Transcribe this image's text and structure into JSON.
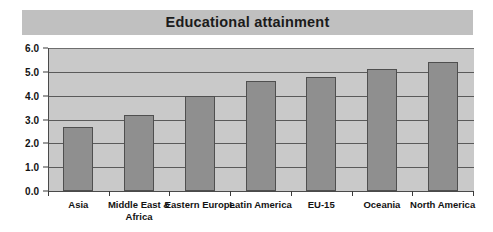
{
  "chart_data": {
    "type": "bar",
    "title": "Educational attainment",
    "xlabel": "",
    "ylabel": "",
    "ylim": [
      0.0,
      6.0
    ],
    "ytick_step": 1.0,
    "ytick_labels": [
      "6.0",
      "5.0",
      "4.0",
      "3.0",
      "2.0",
      "1.0",
      "0.0"
    ],
    "ytick_values": [
      6.0,
      5.0,
      4.0,
      3.0,
      2.0,
      1.0,
      0.0
    ],
    "grid": "horizontal",
    "legend": "none",
    "categories": [
      "Asia",
      "Middle East & Africa",
      "Eastern Europe",
      "Latin America",
      "EU-15",
      "Oceania",
      "North America"
    ],
    "values": [
      2.7,
      3.2,
      4.0,
      4.6,
      4.8,
      5.1,
      5.4
    ],
    "series": [
      {
        "name": "Educational attainment",
        "values": [
          2.7,
          3.2,
          4.0,
          4.6,
          4.8,
          5.1,
          5.4
        ]
      }
    ],
    "colors": {
      "bar_fill": "#8f8f8f",
      "bar_border": "#4f4f4f",
      "plot_background": "#c9c9c9",
      "title_banner": "#c0c0c0",
      "gridline": "#5a5a5a",
      "axis": "#3a3a3a",
      "text": "#131313",
      "page_background": "#ffffff"
    }
  }
}
